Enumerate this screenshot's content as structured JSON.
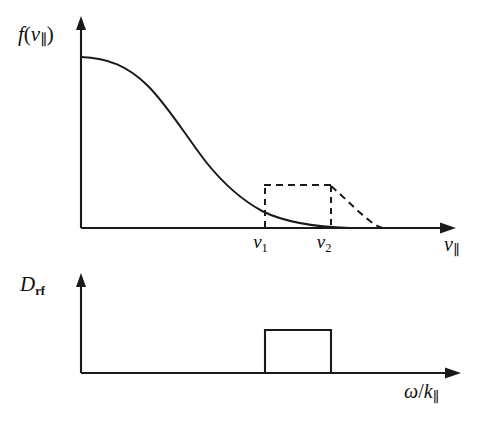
{
  "figure": {
    "caption_implied": "Parallel velocity distribution function flattened into a quasilinear plateau between v1 and v2 by RF diffusion",
    "background_color": "#ffffff",
    "ink_color": "#1a1a1a"
  },
  "panels": {
    "top": {
      "name": "distribution-function-panel",
      "y_axis_label": "f(v∥)",
      "y_axis_label_parts": {
        "function": "f",
        "open": "(",
        "variable": "v",
        "subscript": "∥",
        "close": ")"
      },
      "x_axis_label": "v∥",
      "x_axis_label_parts": {
        "variable": "v",
        "subscript": "∥"
      },
      "x_tick_labels": [
        "v₁",
        "v₂"
      ],
      "ticks": [
        {
          "name": "v1",
          "base": "v",
          "subscript": "1"
        },
        {
          "name": "v2",
          "base": "v",
          "subscript": "2"
        }
      ],
      "curves": [
        {
          "name": "maxwellian-solid-curve",
          "style": "solid",
          "description": "monotonically decreasing bell-shoulder distribution"
        },
        {
          "name": "plateau-dashed-curve",
          "style": "dashed",
          "description": "flattened quasilinear plateau between v1 and v2 with dashed tail rejoining the solid curve"
        }
      ]
    },
    "bottom": {
      "name": "rf-diffusion-panel",
      "y_axis_label": "Dᵣғ",
      "y_axis_label_parts": {
        "base": "D",
        "subscript": "rf"
      },
      "x_axis_label": "ω/k∥",
      "x_axis_label_parts": {
        "omega": "ω",
        "slash": "/",
        "k": "k",
        "subscript": "∥"
      },
      "shapes": [
        {
          "name": "rf-diffusion-box",
          "style": "solid",
          "description": "rectangular top-hat RF diffusion coefficient spanning the resonance region"
        }
      ]
    }
  },
  "chart_data": {
    "type": "line",
    "title": "",
    "subtitle": "",
    "panel_count": 2,
    "panels": [
      {
        "id": "top",
        "title": "",
        "xlabel": "v∥",
        "ylabel": "f(v∥)",
        "grid": false,
        "legend": "none",
        "xlim": [
          0,
          1.0
        ],
        "ylim": [
          0,
          1.0
        ],
        "xticks": [
          0.495,
          0.67
        ],
        "xticklabels": [
          "v₁",
          "v₂"
        ],
        "yticks": [],
        "yticklabels": [],
        "series": [
          {
            "name": "f0-unperturbed",
            "style": "solid",
            "color": "#1a1a1a",
            "x": [
              0.0,
              0.05,
              0.1,
              0.15,
              0.2,
              0.25,
              0.3,
              0.35,
              0.4,
              0.45,
              0.5,
              0.55,
              0.6,
              0.65,
              0.7,
              0.75,
              0.8,
              0.85,
              0.9,
              1.0
            ],
            "y": [
              0.92,
              0.915,
              0.9,
              0.876,
              0.84,
              0.792,
              0.73,
              0.655,
              0.57,
              0.48,
              0.39,
              0.305,
              0.228,
              0.165,
              0.112,
              0.072,
              0.044,
              0.026,
              0.014,
              0.004
            ]
          },
          {
            "name": "f-plateau-perturbed",
            "style": "dashed",
            "color": "#1a1a1a",
            "x": [
              0.495,
              0.495,
              0.67,
              0.67,
              0.72,
              0.78,
              0.84,
              0.9,
              0.945
            ],
            "y": [
              0.0,
              0.396,
              0.396,
              0.0,
              0.33,
              0.225,
              0.128,
              0.052,
              0.01
            ]
          },
          {
            "name": "v1-dashed-dropline",
            "style": "dashed",
            "color": "#1a1a1a",
            "x": [
              0.495,
              0.495
            ],
            "y": [
              0.0,
              0.396
            ]
          },
          {
            "name": "v2-dashed-dropline",
            "style": "dashed",
            "color": "#1a1a1a",
            "x": [
              0.67,
              0.67
            ],
            "y": [
              0.0,
              0.396
            ]
          }
        ]
      },
      {
        "id": "bottom",
        "title": "",
        "xlabel": "ω/k∥",
        "ylabel": "Dᵣғ",
        "grid": false,
        "legend": "none",
        "xlim": [
          0,
          1.0
        ],
        "ylim": [
          0,
          1.0
        ],
        "xticks": [],
        "xticklabels": [],
        "yticks": [],
        "yticklabels": [],
        "series": [
          {
            "name": "rf-diffusion-top-hat",
            "style": "solid",
            "color": "#1a1a1a",
            "x": [
              0.0,
              0.486,
              0.486,
              0.661,
              0.661,
              1.0
            ],
            "y": [
              0.0,
              0.0,
              0.62,
              0.62,
              0.0,
              0.0
            ]
          }
        ]
      }
    ]
  }
}
